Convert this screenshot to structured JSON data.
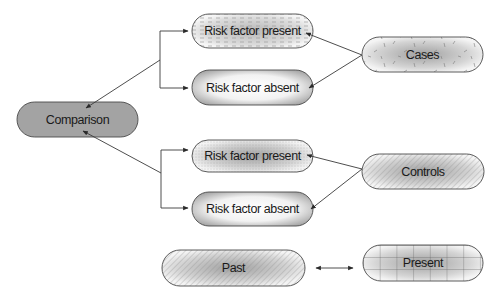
{
  "diagram": {
    "type": "case-control study design",
    "nodes": {
      "comparison": {
        "label": "Comparison",
        "fill": "#a3a3a3",
        "pattern": "solid"
      },
      "cases_present": {
        "label": "Risk factor present",
        "pattern": "dashed-dots"
      },
      "cases_absent": {
        "label": "Risk factor absent",
        "pattern": "radial-gradient"
      },
      "cases": {
        "label": "Cases",
        "pattern": "speckle"
      },
      "controls_present": {
        "label": "Risk factor present",
        "pattern": "stipple-gradient"
      },
      "controls_absent": {
        "label": "Risk factor absent",
        "pattern": "radial-gradient"
      },
      "controls": {
        "label": "Controls",
        "pattern": "diagonal-hatch"
      },
      "past": {
        "label": "Past",
        "pattern": "diagonal-hatch"
      },
      "present": {
        "label": "Present",
        "pattern": "grid"
      }
    },
    "edges": [
      {
        "from": "cases",
        "to": "cases_present"
      },
      {
        "from": "cases",
        "to": "cases_absent"
      },
      {
        "from": "controls",
        "to": "controls_present"
      },
      {
        "from": "controls",
        "to": "controls_absent"
      },
      {
        "from": "cases_present",
        "to": "comparison",
        "via": "bracket"
      },
      {
        "from": "cases_absent",
        "to": "comparison",
        "via": "bracket"
      },
      {
        "from": "controls_present",
        "to": "comparison",
        "via": "bracket"
      },
      {
        "from": "controls_absent",
        "to": "comparison",
        "via": "bracket"
      },
      {
        "from": "past",
        "to": "present",
        "type": "bidirectional"
      }
    ],
    "colors": {
      "stroke": "#3a3a3a",
      "text": "#1a1a1a",
      "comparison_fill": "#a3a3a3"
    }
  }
}
